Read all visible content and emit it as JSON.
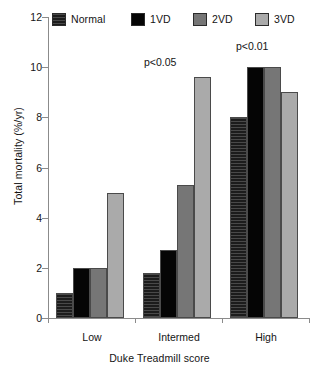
{
  "chart_data": {
    "type": "bar",
    "title": "",
    "xlabel": "Duke Treadmill score",
    "ylabel": "Total mortality (%/yr)",
    "categories": [
      "Low",
      "Intermed",
      "High"
    ],
    "ylim": [
      0,
      12
    ],
    "yticks": [
      0,
      2,
      4,
      6,
      8,
      10,
      12
    ],
    "ytick_labels": [
      "0",
      "2",
      "4",
      "6",
      "8",
      "10",
      "12"
    ],
    "grid": false,
    "legend_position": "top",
    "series": [
      {
        "name": "Normal",
        "values": [
          1.0,
          1.8,
          8.0
        ],
        "color": "#1c1c1c",
        "pattern": "hatched"
      },
      {
        "name": "1VD",
        "values": [
          2.0,
          2.7,
          10.0
        ],
        "color": "#050505",
        "pattern": "solid"
      },
      {
        "name": "2VD",
        "values": [
          2.0,
          5.3,
          10.0
        ],
        "color": "#767676",
        "pattern": "solid"
      },
      {
        "name": "3VD",
        "values": [
          5.0,
          9.6,
          9.0
        ],
        "color": "#aaaaaa",
        "pattern": "solid"
      }
    ],
    "annotations": [
      {
        "text": "p<0.05",
        "group": "Intermed"
      },
      {
        "text": "p<0.01",
        "group": "High"
      }
    ]
  },
  "legend": {
    "items": [
      {
        "label": "Normal"
      },
      {
        "label": "1VD"
      },
      {
        "label": "2VD"
      },
      {
        "label": "3VD"
      }
    ]
  },
  "axes": {
    "y_title": "Total mortality (%/yr)",
    "x_title": "Duke Treadmill score",
    "y_labels": [
      "12",
      "10",
      "8",
      "6",
      "4",
      "2",
      "0"
    ],
    "x_labels": [
      "Low",
      "Intermed",
      "High"
    ]
  },
  "annotations": {
    "intermed_p": "p<0.05",
    "high_p": "p<0.01"
  }
}
